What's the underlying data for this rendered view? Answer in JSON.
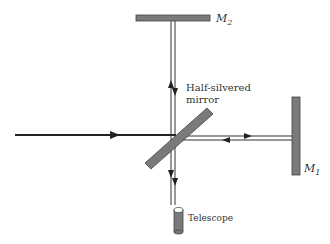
{
  "diagram": {
    "labels": {
      "mirror_2": "M",
      "mirror_2_sub": "2",
      "mirror_1": "M",
      "mirror_1_sub": "1",
      "beam_splitter_line1": "Half-silvered",
      "beam_splitter_line2": "mirror",
      "telescope": "Telescope"
    },
    "colors": {
      "mirror_fill": "#7a7a7a",
      "mirror_stroke": "#444444",
      "beam": "#333333",
      "text": "#333333"
    }
  }
}
